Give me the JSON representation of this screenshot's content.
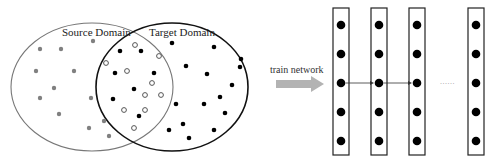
{
  "diagram": {
    "source_domain": {
      "label": "Source Domain",
      "stroke_color": "#777777",
      "point_color": "#808080",
      "points": [
        [
          93,
          41
        ],
        [
          40,
          49
        ],
        [
          61,
          49
        ],
        [
          36,
          71
        ],
        [
          74,
          71
        ],
        [
          54,
          88
        ],
        [
          40,
          98
        ],
        [
          91,
          98
        ],
        [
          59,
          114
        ],
        [
          104,
          121
        ],
        [
          89,
          128
        ],
        [
          109,
          136
        ]
      ]
    },
    "target_domain": {
      "label": "Target Domain",
      "stroke_color": "#111111",
      "point_color": "#000000",
      "points": [
        [
          172,
          43
        ],
        [
          214,
          47
        ],
        [
          241,
          59
        ],
        [
          240,
          67
        ],
        [
          186,
          66
        ],
        [
          207,
          74
        ],
        [
          232,
          85
        ],
        [
          220,
          97
        ],
        [
          176,
          104
        ],
        [
          204,
          104
        ],
        [
          225,
          113
        ],
        [
          183,
          124
        ],
        [
          169,
          130
        ],
        [
          214,
          130
        ],
        [
          189,
          138
        ]
      ]
    },
    "overlap": {
      "filled_points": [
        [
          120,
          51
        ],
        [
          141,
          51
        ],
        [
          115,
          73
        ],
        [
          154,
          73
        ],
        [
          134,
          89
        ],
        [
          113,
          99
        ],
        [
          139,
          116
        ]
      ],
      "hollow_points": [
        [
          135,
          45
        ],
        [
          106,
          63
        ],
        [
          159,
          56
        ],
        [
          127,
          71
        ],
        [
          152,
          83
        ],
        [
          145,
          95
        ],
        [
          161,
          95
        ],
        [
          124,
          110
        ],
        [
          145,
          110
        ],
        [
          134,
          128
        ]
      ],
      "hollow_stroke": "#555555"
    },
    "transition": {
      "label": "train network",
      "arrow_color": "#b3b3b3"
    },
    "network": {
      "node_color": "#000000",
      "box_stroke": "#222222",
      "layers": [
        {
          "name": "layer-1",
          "nodes": 5
        },
        {
          "name": "layer-2",
          "nodes": 5
        },
        {
          "name": "layer-3",
          "nodes": 5
        },
        {
          "name": "layer-n",
          "nodes": 5
        }
      ],
      "ellipsis": "......"
    }
  }
}
